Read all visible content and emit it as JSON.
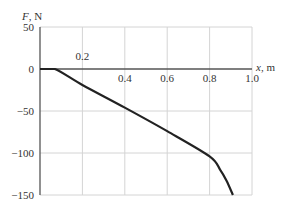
{
  "chart_data": {
    "type": "line",
    "title": "",
    "xlabel": "x, m",
    "ylabel": "F, N",
    "xlim": [
      0,
      1.0
    ],
    "ylim": [
      -150,
      50
    ],
    "grid": true,
    "x_ticks": [
      0.2,
      0.4,
      0.6,
      0.8,
      1.0
    ],
    "x_tick_labels": [
      "0.2",
      "0.4",
      "0.6",
      "0.8",
      "1.0"
    ],
    "y_ticks": [
      50,
      0,
      -50,
      -100,
      -150
    ],
    "y_tick_labels": [
      "50",
      "0",
      "−50",
      "−100",
      "−150"
    ],
    "series": [
      {
        "name": "F(x)",
        "color": "#222222",
        "x": [
          0.0,
          0.07,
          0.2,
          0.4,
          0.6,
          0.8,
          0.85,
          0.88,
          0.91
        ],
        "y": [
          0,
          0,
          -19,
          -46,
          -74,
          -104,
          -120,
          -133,
          -150
        ]
      }
    ]
  },
  "labels": {
    "y_axis": "F, N",
    "x_axis": "x, m"
  }
}
